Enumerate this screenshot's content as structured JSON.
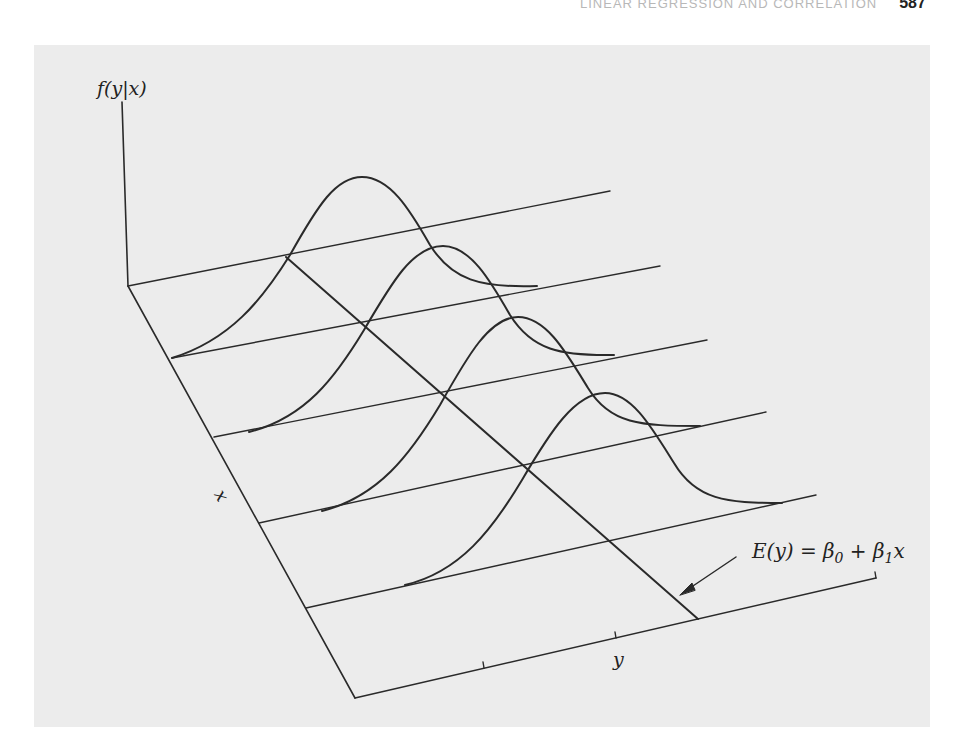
{
  "header": {
    "running_title": "LINEAR REGRESSION AND CORRELATION",
    "page_number": "587"
  },
  "diagram": {
    "labels": {
      "vertical_axis": "f(y|x)",
      "depth_axis": "x",
      "horizontal_axis": "y",
      "regression_equation": "E(y) = β0 + β1x"
    },
    "elements": {
      "vertical_axis": "f(y|x) axis",
      "x_axis": "x axis (depth)",
      "y_axis": "y axis (horizontal, with 3 tick marks)",
      "grid_lines": 5,
      "normal_curves": 4,
      "regression_line": "mean line E(y) crossing the grid diagonally",
      "arrow": "points to regression line"
    }
  },
  "colors": {
    "panel_background": "#ececec",
    "ink": "#2a2a2a",
    "header_text": "#b8b8b8"
  }
}
